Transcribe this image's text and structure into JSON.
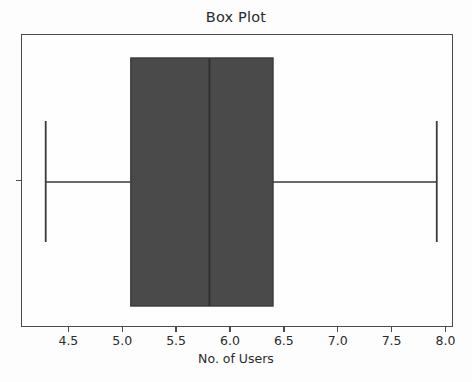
{
  "chart_data": {
    "type": "box",
    "title": "Box Plot",
    "xlabel": "No. of Users",
    "ylabel": "",
    "orientation": "horizontal",
    "grid": false,
    "legend": null,
    "xlim": [
      4.06,
      8.07
    ],
    "xticks": [
      4.5,
      5.0,
      5.5,
      6.0,
      6.5,
      7.0,
      7.5,
      8.0
    ],
    "xticklabels": [
      "4.5",
      "5.0",
      "5.5",
      "6.0",
      "6.5",
      "7.0",
      "7.5",
      "8.0"
    ],
    "yticks": [
      1
    ],
    "yticklabels": [
      ""
    ],
    "boxes": [
      {
        "name": "No. of Users",
        "whisker_low": 4.28,
        "q1": 5.07,
        "median": 5.8,
        "q3": 6.39,
        "whisker_high": 7.91,
        "outliers": [],
        "box_fill": "#4a4a4a",
        "line_color": "#3a3a3a"
      }
    ],
    "colors": {
      "box_fill": "#4a4a4a",
      "line": "#3a3a3a",
      "axis": "#4b4b4b",
      "text": "#2b2b2b",
      "background": "#fdfdfd"
    }
  },
  "figure": {
    "title": "Box Plot",
    "xaxis_label": "No. of Users"
  }
}
